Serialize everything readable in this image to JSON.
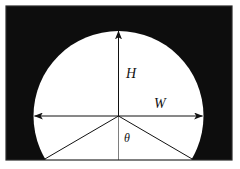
{
  "figure": {
    "name": "tunnel-cross-section-diagram",
    "background_color": "#ffffff",
    "fill_color": "#0d0d0d",
    "shape_color": "#ffffff",
    "line_color": "#111111",
    "frame": {
      "x": 6,
      "y": 6,
      "width": 226,
      "height": 154,
      "border_color": "#2a2a2a"
    },
    "circle": {
      "center_x": 118.5,
      "center_y": 116,
      "radius": 85
    },
    "labels": {
      "height": "H",
      "width": "W",
      "angle": "θ"
    },
    "label_positions": {
      "height": {
        "x": 126,
        "y": 78
      },
      "width": {
        "x": 154,
        "y": 108
      },
      "angle": {
        "x": 124,
        "y": 142
      }
    },
    "dimensions": {
      "height_arrow": {
        "from_x": 118.5,
        "from_y": 116,
        "to_x": 118.5,
        "to_y": 31
      },
      "width_arrow": {
        "from_x": 33.5,
        "from_y": 116,
        "to_x": 203.5,
        "to_y": 116
      },
      "angle_rays": [
        {
          "from_x": 118.5,
          "from_y": 116,
          "to_x": 44,
          "to_y": 159
        },
        {
          "from_x": 118.5,
          "from_y": 116,
          "to_x": 193,
          "to_y": 159
        }
      ]
    }
  }
}
